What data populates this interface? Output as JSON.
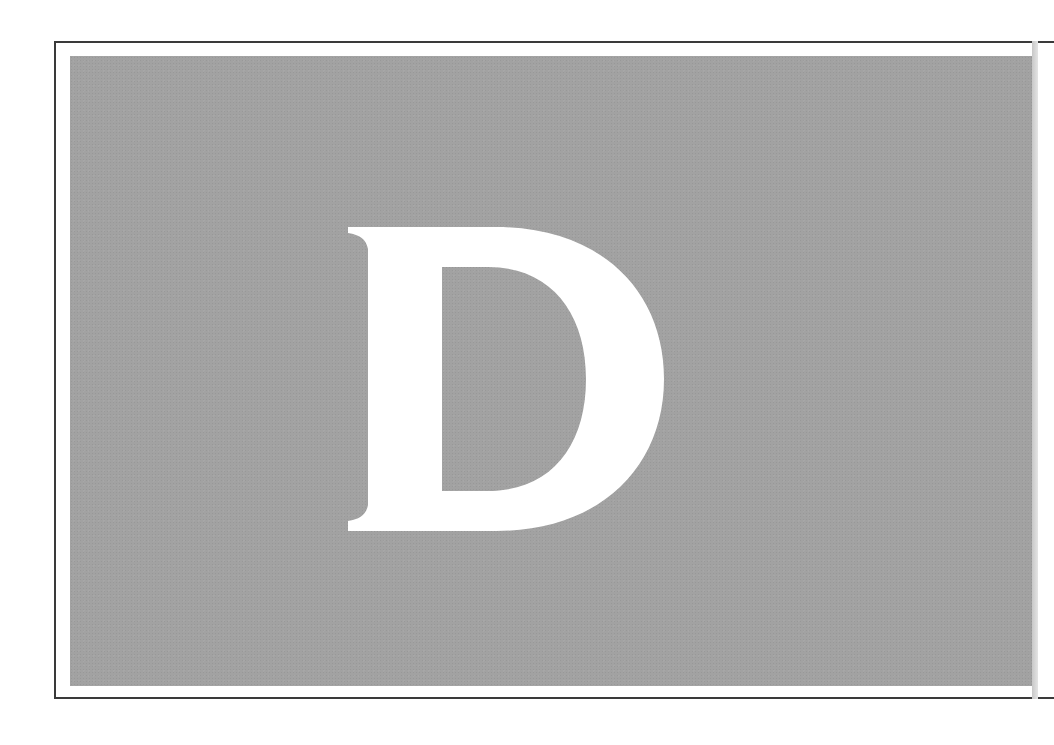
{
  "page": {
    "type": "decorative drop-cap panel",
    "drop_cap": {
      "letter": "D",
      "color": "#ffffff"
    },
    "colors": {
      "panel_background": "#a2a2a2",
      "frame_border": "#3a3a3a",
      "page_background": "#ffffff"
    }
  }
}
